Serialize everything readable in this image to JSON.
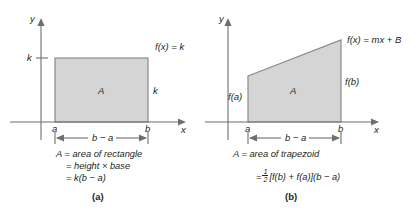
{
  "figure": {
    "background_color": "#ffffff",
    "ink_color": "#231f20",
    "region_fill_color": "#d5d5d5",
    "region_stroke_color": "#8a8a8a",
    "axis_color": "#6e6e6e"
  },
  "panels": [
    {
      "id": "a",
      "caption": "(a)",
      "axes": {
        "y_label": "y",
        "x_label": "x",
        "y_tick_label": "k"
      },
      "region_label": "A",
      "function_label": "f(x) = k",
      "height_label": "k",
      "x_tick_labels": {
        "left": "a",
        "right": "b"
      },
      "measure_label": "b − a",
      "formula_lines": [
        "A = area of rectangle",
        "= height × base",
        "= k(b − a)"
      ]
    },
    {
      "id": "b",
      "caption": "(b)",
      "axes": {
        "y_label": "y",
        "x_label": "x"
      },
      "region_label": "A",
      "function_label": "f(x) = mx + B",
      "left_height_label": "f(a)",
      "right_height_label": "f(b)",
      "x_tick_labels": {
        "left": "a",
        "right": "b"
      },
      "measure_label": "b − a",
      "formula_lines": [
        "A = area of trapezoid"
      ],
      "formula_fraction": {
        "prefix": "=",
        "numerator": "1",
        "denominator": "2",
        "suffix": "[f(b) + f(a)](b − a)"
      }
    }
  ]
}
